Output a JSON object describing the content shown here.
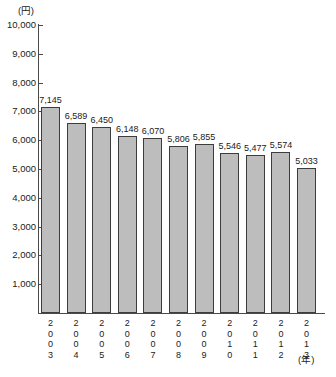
{
  "chart_data": {
    "type": "bar",
    "title": "",
    "xlabel": "(年)",
    "ylabel": "(円)",
    "categories": [
      "2003",
      "2004",
      "2005",
      "2006",
      "2007",
      "2008",
      "2009",
      "2010",
      "2011",
      "2012",
      "2013"
    ],
    "values": [
      7145,
      6589,
      6450,
      6148,
      6070,
      5806,
      5855,
      5546,
      5477,
      5574,
      5033
    ],
    "value_labels": [
      "7,145",
      "6,589",
      "6,450",
      "6,148",
      "6,070",
      "5,806",
      "5,855",
      "5,546",
      "5,477",
      "5,574",
      "5,033"
    ],
    "ylim": [
      0,
      10000
    ],
    "ytick_values": [
      10000,
      9000,
      8000,
      7000,
      6000,
      5000,
      4000,
      3000,
      2000,
      1000
    ],
    "ytick_labels": [
      "10,000",
      "9,000",
      "8,000",
      "7,000",
      "6,000",
      "5,000",
      "4,000",
      "3,000",
      "2,000",
      "1,000"
    ],
    "grid": false,
    "legend": false,
    "bar_fill_color": "#bdbdbd",
    "bar_edge_color": "#3d3d3d",
    "axis_color": "#4a4a4a"
  }
}
